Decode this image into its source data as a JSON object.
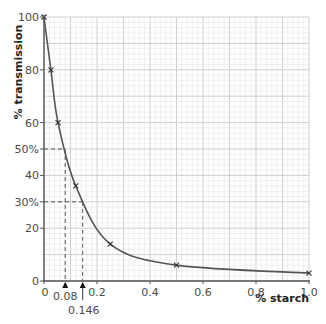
{
  "chart_data": {
    "type": "line",
    "title": "",
    "xlabel": "% starch",
    "ylabel": "% transmission",
    "xlim": [
      0,
      1.0
    ],
    "ylim": [
      0,
      100
    ],
    "grid": true,
    "x_ticks": [
      {
        "value": 0,
        "label": "0"
      },
      {
        "value": 0.2,
        "label": "0.2"
      },
      {
        "value": 0.4,
        "label": "0.4"
      },
      {
        "value": 0.6,
        "label": "0.6"
      },
      {
        "value": 0.8,
        "label": "0.8"
      },
      {
        "value": 1.0,
        "label": "1.0"
      }
    ],
    "y_ticks": [
      {
        "value": 0,
        "label": "0"
      },
      {
        "value": 20,
        "label": "20"
      },
      {
        "value": 30,
        "label": "30%"
      },
      {
        "value": 40,
        "label": "40"
      },
      {
        "value": 50,
        "label": "50%"
      },
      {
        "value": 60,
        "label": "60"
      },
      {
        "value": 80,
        "label": "80"
      },
      {
        "value": 100,
        "label": "100"
      }
    ],
    "series": [
      {
        "name": "calibration curve",
        "marker": "x",
        "x": [
          0,
          0.026,
          0.053,
          0.12,
          0.25,
          0.5,
          1.0
        ],
        "y": [
          100,
          80,
          60,
          36,
          14,
          6,
          3
        ]
      }
    ],
    "annotations": [
      {
        "type": "dashed-reading",
        "y": 50,
        "x": 0.08,
        "y_label": "50%",
        "x_label": "0.08"
      },
      {
        "type": "dashed-reading",
        "y": 30,
        "x": 0.146,
        "y_label": "30%",
        "x_label": "0.146"
      }
    ]
  }
}
